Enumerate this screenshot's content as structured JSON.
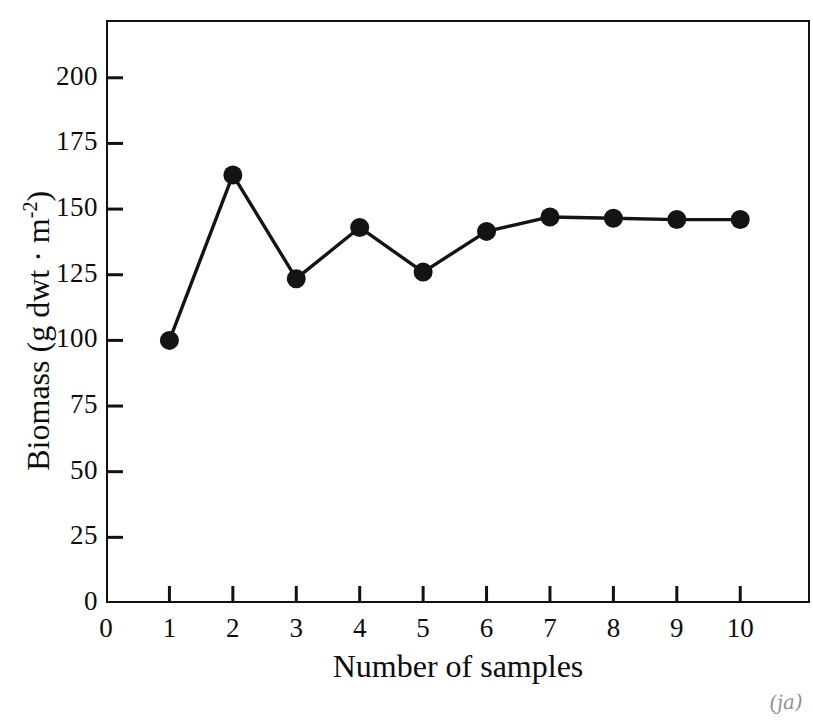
{
  "figure": {
    "corner_mark": "(ja)"
  },
  "chart_data": {
    "type": "line",
    "title": "",
    "xlabel": "Number of samples",
    "ylabel": "Biomass (g dwt · m-2)",
    "ylabel_parts": {
      "main": "Biomass (g dwt · m",
      "exponent": "-2",
      "close": ")"
    },
    "x": [
      1,
      2,
      3,
      4,
      5,
      6,
      7,
      8,
      9,
      10
    ],
    "values": [
      100,
      163,
      123.5,
      143,
      126,
      141.5,
      147,
      146.5,
      146,
      146
    ],
    "xlim": [
      0,
      11.1
    ],
    "ylim": [
      0,
      222
    ],
    "xticks": [
      0,
      1,
      2,
      3,
      4,
      5,
      6,
      7,
      8,
      9,
      10
    ],
    "xtick_labels": [
      "0",
      "1",
      "2",
      "3",
      "4",
      "5",
      "6",
      "7",
      "8",
      "9",
      "10"
    ],
    "yticks": [
      0,
      25,
      50,
      75,
      100,
      125,
      150,
      175,
      200
    ],
    "ytick_labels": [
      "0",
      "25",
      "50",
      "75",
      "100",
      "125",
      "150",
      "175",
      "200"
    ],
    "grid": false,
    "legend": "none",
    "marker": "filled-circle",
    "marker_color": "#141414",
    "line_color": "#141414"
  }
}
